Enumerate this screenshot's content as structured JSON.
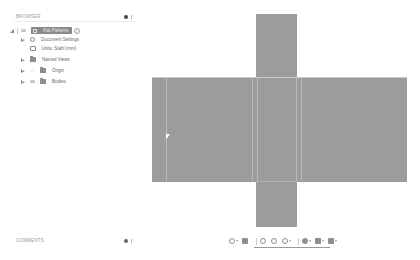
{
  "browser": {
    "title": "BROWSER",
    "root": {
      "label": "Flat Patterns",
      "active": true
    },
    "items": [
      {
        "label": "Document Settings",
        "icon": "gear-icon",
        "expandable": true
      },
      {
        "label": "Units: Stahl (mm)",
        "icon": "units-icon",
        "expandable": false
      },
      {
        "label": "Named Views",
        "icon": "folder-icon",
        "expandable": true
      },
      {
        "label": "Origin",
        "icon": "folder-icon",
        "expandable": true,
        "visible": false
      },
      {
        "label": "Bodies",
        "icon": "folder-icon",
        "expandable": true,
        "visible": true
      }
    ]
  },
  "comments": {
    "title": "COMMENTS"
  },
  "canvas": {
    "face_color": "#9c9c9c",
    "edge_color": "#b9b9b9",
    "shape": "cross-flat-pattern"
  },
  "nav_toolbar": {
    "tools": [
      {
        "name": "orbit-icon",
        "has_menu": true
      },
      {
        "name": "look-at-icon",
        "has_menu": false
      },
      {
        "name": "pan-icon",
        "has_menu": false
      },
      {
        "name": "zoom-icon",
        "has_menu": false
      },
      {
        "name": "fit-icon",
        "has_menu": true
      },
      {
        "name": "display-settings-icon",
        "has_menu": true
      },
      {
        "name": "grid-icon",
        "has_menu": true
      },
      {
        "name": "viewports-icon",
        "has_menu": true
      }
    ]
  }
}
